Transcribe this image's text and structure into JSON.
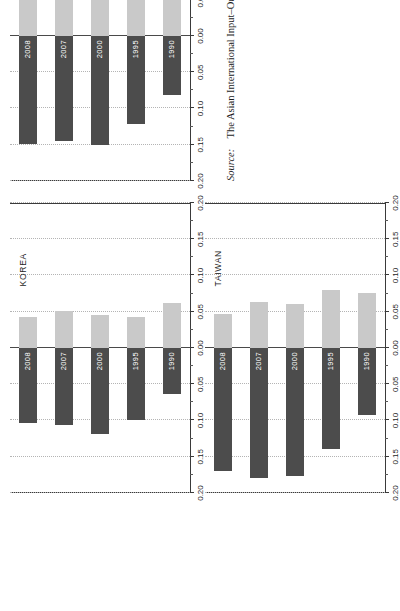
{
  "figure": {
    "orientation": "rotated-90",
    "source_keyword": "Source:",
    "source_text": "The Asian International Input–Output Tables.",
    "colors": {
      "positive_bar": "#c9c9c9",
      "negative_bar": "#4c4c4c",
      "axis": "#3a3a3a",
      "gridline": "#b4b4b4",
      "text": "#1d1d1d",
      "bar_label": "#ffffff",
      "background": "#ffffff"
    }
  },
  "axis": {
    "tick_labels": [
      "0.20",
      "0.15",
      "0.10",
      "0.05",
      "0.00",
      "0.05",
      "0.10",
      "0.15",
      "0.20"
    ],
    "tick_values": [
      -0.2,
      -0.15,
      -0.1,
      -0.05,
      0.0,
      0.05,
      0.1,
      0.15,
      0.2
    ],
    "min": -0.2,
    "max": 0.2,
    "step": 0.05
  },
  "chart_data": [
    {
      "type": "bar",
      "title": "KOREA",
      "xlabel": "",
      "ylabel": "",
      "ylim": [
        -0.2,
        0.2
      ],
      "grid": true,
      "orientation": "horizontal-grouped",
      "categories": [
        "1990",
        "1995",
        "2000",
        "2007",
        "2008"
      ],
      "series": [
        {
          "name": "positive",
          "values": [
            0.062,
            0.043,
            0.046,
            0.051,
            0.043
          ]
        },
        {
          "name": "negative",
          "values": [
            -0.064,
            -0.1,
            -0.119,
            -0.106,
            -0.104
          ]
        }
      ]
    },
    {
      "type": "bar",
      "title": "TAIWAN",
      "xlabel": "",
      "ylabel": "",
      "ylim": [
        -0.2,
        0.2
      ],
      "grid": true,
      "orientation": "horizontal-grouped",
      "categories": [
        "1990",
        "1995",
        "2000",
        "2007",
        "2008"
      ],
      "series": [
        {
          "name": "positive",
          "values": [
            0.076,
            0.08,
            0.06,
            0.064,
            0.047
          ]
        },
        {
          "name": "negative",
          "values": [
            -0.092,
            -0.139,
            -0.177,
            -0.18,
            -0.169
          ]
        }
      ]
    },
    {
      "type": "bar",
      "title": "THAILAND",
      "xlabel": "",
      "ylabel": "",
      "ylim": [
        -0.2,
        0.2
      ],
      "grid": true,
      "orientation": "horizontal-grouped",
      "categories": [
        "1990",
        "1995",
        "2000",
        "2007",
        "2008"
      ],
      "series": [
        {
          "name": "positive",
          "values": [
            0.082,
            0.085,
            0.084,
            0.085,
            0.06
          ]
        },
        {
          "name": "negative",
          "values": [
            -0.082,
            -0.121,
            -0.15,
            -0.145,
            -0.149
          ]
        }
      ]
    }
  ],
  "panels": [
    {
      "title": "KOREA",
      "left": 118,
      "top": 10,
      "width": 290,
      "height": 180
    },
    {
      "title": "TAIWAN",
      "left": 118,
      "top": 205,
      "width": 290,
      "height": 180
    },
    {
      "title": "THAILAND",
      "left": 430,
      "top": 10,
      "width": 290,
      "height": 180
    }
  ]
}
